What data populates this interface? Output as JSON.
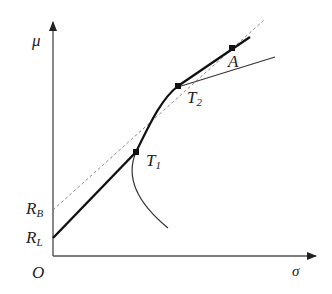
{
  "diagram": {
    "type": "capital-market-line-diagram",
    "axes": {
      "y_label": "μ",
      "x_label": "σ",
      "origin_label": "O"
    },
    "intercepts": {
      "lending_rate": {
        "main": "R",
        "sub": "L"
      },
      "borrowing_rate": {
        "main": "R",
        "sub": "B"
      }
    },
    "points": {
      "t1": {
        "main": "T",
        "sub": "1"
      },
      "t2": {
        "main": "T",
        "sub": "2"
      },
      "a": {
        "main": "A"
      }
    },
    "colors": {
      "axis": "#555555",
      "thick_line": "#111111",
      "dashed_line": "#888888",
      "frontier": "#333333"
    }
  }
}
